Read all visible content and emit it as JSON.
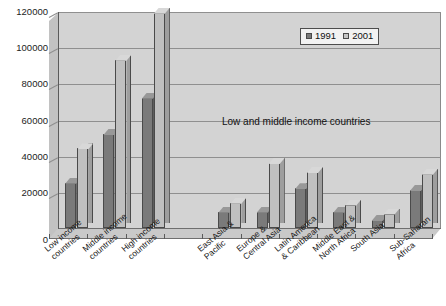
{
  "chart_data": {
    "type": "bar",
    "title": "",
    "subtitle": "",
    "xlabel": "",
    "ylabel": "",
    "ylim": [
      0,
      120000
    ],
    "ytick_labels": [
      "120000",
      "100000",
      "80000",
      "60000",
      "40000",
      "20000",
      "0"
    ],
    "ytick_values": [
      120000,
      100000,
      80000,
      60000,
      40000,
      20000,
      0
    ],
    "grid": true,
    "legend_position": "top-right",
    "categories": [
      "Low income countries",
      "Middle income countries",
      "High income countries",
      "",
      "East Asia & Pacific",
      "Europe & Central Asia",
      "Latin America & Caribbean",
      "Middle East & North Africa",
      "South Asia",
      "Sub-Saharan Africa"
    ],
    "category_lines": [
      [
        "Low income",
        "countries"
      ],
      [
        "Middle income",
        "countries"
      ],
      [
        "High income",
        "countries"
      ],
      [],
      [
        "East Asia &",
        "Pacific"
      ],
      [
        "Europe &",
        "Central Asia"
      ],
      [
        "Latin America",
        "& Caribbean"
      ],
      [
        "Middle East &",
        "North Africa"
      ],
      [
        "South Asia"
      ],
      [
        "Sub-Saharan",
        "Africa"
      ]
    ],
    "series": [
      {
        "name": "1991",
        "color": "#7a7a7a",
        "values": [
          25000,
          52000,
          72000,
          null,
          9000,
          9000,
          22000,
          9000,
          4500,
          21000
        ]
      },
      {
        "name": "2001",
        "color": "#c0c0c0",
        "values": [
          44000,
          93000,
          119000,
          null,
          14000,
          36000,
          31000,
          13000,
          8000,
          30000
        ]
      }
    ],
    "annotations": [
      {
        "text": "Low and middle income countries"
      }
    ]
  },
  "legend": {
    "items": [
      {
        "label": "1991",
        "color": "#7a7a7a"
      },
      {
        "label": "2001",
        "color": "#c6c6c6"
      }
    ]
  },
  "annotation_text": "Low and middle income countries",
  "colors": {
    "plot_background": "#d3d3d3",
    "gridline": "#8f8f8f",
    "axis": "#5a5a5a",
    "series_1991": "#7a7a7a",
    "series_2001": "#c0c0c0",
    "page_background": "#ffffff"
  }
}
